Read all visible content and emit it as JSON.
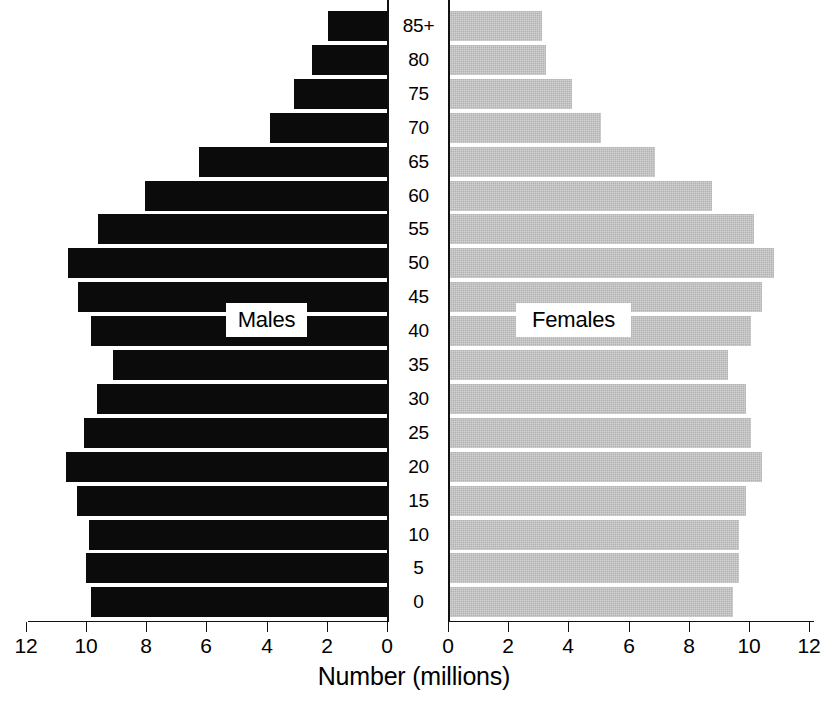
{
  "chart_data": {
    "type": "bar",
    "subtype": "population-pyramid",
    "title": "",
    "xlabel": "Number (millions)",
    "ylabel": "",
    "categories": [
      "0",
      "5",
      "10",
      "15",
      "20",
      "25",
      "30",
      "35",
      "40",
      "45",
      "50",
      "55",
      "60",
      "65",
      "70",
      "75",
      "80",
      "85+"
    ],
    "category_order_top_to_bottom": [
      "85+",
      "80",
      "75",
      "70",
      "65",
      "60",
      "55",
      "50",
      "45",
      "40",
      "35",
      "30",
      "25",
      "20",
      "15",
      "10",
      "5",
      "0"
    ],
    "xlim_left": [
      12,
      0
    ],
    "xlim_right": [
      0,
      12
    ],
    "x_ticks_left": [
      "12",
      "10",
      "8",
      "6",
      "4",
      "2",
      "0"
    ],
    "x_ticks_right": [
      "0",
      "2",
      "4",
      "6",
      "8",
      "10",
      "12"
    ],
    "x_tick_values": [
      0,
      2,
      4,
      6,
      8,
      10,
      12
    ],
    "grid": false,
    "legend_position": "inline-overlay",
    "series": [
      {
        "name": "Males",
        "color": "#0b0b0b",
        "side": "left",
        "values_top_to_bottom": [
          1.95,
          2.5,
          3.1,
          3.9,
          6.25,
          8.05,
          9.6,
          10.6,
          10.25,
          9.85,
          9.1,
          9.65,
          10.05,
          10.65,
          10.3,
          9.9,
          10.0,
          9.85
        ],
        "values_by_age": {
          "0": 9.85,
          "5": 10.0,
          "10": 9.9,
          "15": 10.3,
          "20": 10.65,
          "25": 10.05,
          "30": 9.65,
          "35": 9.1,
          "40": 9.85,
          "45": 10.25,
          "50": 10.6,
          "55": 9.6,
          "60": 8.05,
          "65": 6.25,
          "70": 3.9,
          "75": 3.1,
          "80": 2.5,
          "85+": 1.95
        }
      },
      {
        "name": "Females",
        "color": "#b3b3b3",
        "side": "right",
        "values_top_to_bottom": [
          3.05,
          3.2,
          4.05,
          5.0,
          6.8,
          8.7,
          10.1,
          10.75,
          10.35,
          10.0,
          9.25,
          9.85,
          10.0,
          10.35,
          9.85,
          9.6,
          9.6,
          9.4
        ],
        "values_by_age": {
          "0": 9.4,
          "5": 9.6,
          "10": 9.6,
          "15": 9.85,
          "20": 10.35,
          "25": 10.0,
          "30": 9.85,
          "35": 9.25,
          "40": 10.0,
          "45": 10.35,
          "50": 10.75,
          "55": 10.1,
          "60": 8.7,
          "65": 6.8,
          "70": 5.0,
          "75": 4.05,
          "80": 3.2,
          "85+": 3.05
        }
      }
    ]
  },
  "labels": {
    "males": "Males",
    "females": "Females",
    "xlabel": "Number (millions)"
  },
  "colors": {
    "male_bar": "#0b0b0b",
    "female_bar": "#b3b3b3",
    "axis": "#111111",
    "background": "#ffffff"
  }
}
